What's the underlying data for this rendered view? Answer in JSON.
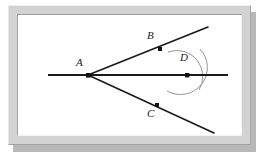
{
  "figure": {
    "background_color": "#ffffff",
    "frame_color": "#d2d2d2",
    "line_color": "#1a1a1a",
    "arc_color": "#777777",
    "points": [
      {
        "id": "A",
        "label": "A",
        "x": 88,
        "y": 75,
        "label_x": 76,
        "label_y": 62,
        "role": "vertex"
      },
      {
        "id": "B",
        "label": "B",
        "x": 160,
        "y": 49,
        "label_x": 147,
        "label_y": 34,
        "role": "ray-point-upper"
      },
      {
        "id": "C",
        "label": "C",
        "x": 157,
        "y": 105,
        "label_x": 147,
        "label_y": 110,
        "role": "ray-point-lower"
      },
      {
        "id": "D",
        "label": "D",
        "x": 187,
        "y": 75,
        "label_x": 180,
        "label_y": 56,
        "role": "arc-intersection"
      }
    ],
    "segments": [
      {
        "id": "bisector",
        "name": "horizontal-bisector-line",
        "x1": 48,
        "y1": 75,
        "x2": 228,
        "y2": 75
      },
      {
        "id": "ray-ab",
        "name": "upper-ray-through-b",
        "x1": 88,
        "y1": 75,
        "x2": 208,
        "y2": 27
      },
      {
        "id": "ray-ac",
        "name": "lower-ray-through-c",
        "x1": 88,
        "y1": 75,
        "x2": 214,
        "y2": 133
      }
    ],
    "arcs": [
      {
        "id": "arc-upper",
        "name": "construction-arc-upper",
        "path": "M 168 55 A 26 26 0 0 1 199 93"
      },
      {
        "id": "arc-lower",
        "name": "construction-arc-lower",
        "path": "M 167 94 A 27 27 0 0 0 200 52"
      }
    ],
    "dot_radius": 2.2,
    "line_width": 1.6,
    "arc_width": 0.9
  }
}
